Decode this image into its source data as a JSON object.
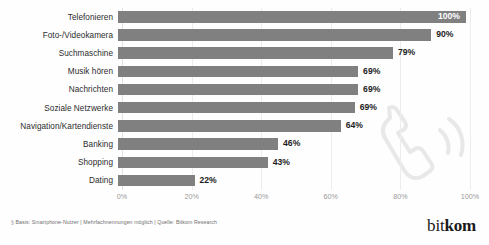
{
  "figure": {
    "title_strip": "",
    "watermark_icon": "telephone-handset-icon",
    "logo": {
      "part1": "bit",
      "part2": "kom"
    },
    "footer": {
      "marker": "§",
      "text": "Basis: Smartphone-Nutzer | Mehrfachnennungen möglich | Quelle: Bitkom Research"
    }
  },
  "chart_data": {
    "type": "bar",
    "orientation": "horizontal",
    "title": "",
    "xlabel": "",
    "ylabel": "",
    "xlim": [
      0,
      100
    ],
    "grid": true,
    "legend": "none",
    "xticks": [
      "0%",
      "20%",
      "40%",
      "60%",
      "80%",
      "100%"
    ],
    "xtick_values": [
      0,
      20,
      40,
      60,
      80,
      100
    ],
    "categories": [
      "Telefonieren",
      "Foto-/Videokamera",
      "Suchmaschine",
      "Musik hören",
      "Nachrichten",
      "Soziale Netzwerke",
      "Navigation/Kartendienste",
      "Banking",
      "Shopping",
      "Dating"
    ],
    "values": [
      100,
      90,
      79,
      69,
      69,
      68,
      64,
      46,
      43,
      22
    ],
    "data_labels": [
      "100%",
      "90%",
      "79%",
      "69%",
      "69%",
      "69%",
      "64%",
      "46%",
      "43%",
      "22%"
    ],
    "label_inside": [
      true,
      false,
      false,
      false,
      false,
      false,
      false,
      false,
      false,
      false
    ],
    "bar_color": "#808080",
    "label_color": "#1d1d1d",
    "inside_label_color": "#ffffff"
  }
}
